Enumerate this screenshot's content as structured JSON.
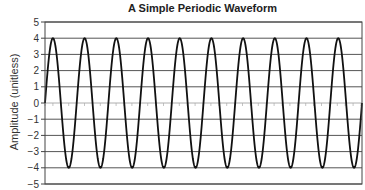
{
  "chart_data": {
    "type": "line",
    "title": "A Simple Periodic Waveform",
    "xlabel": "",
    "ylabel": "Amplitude (unitless)",
    "ylim": [
      -5,
      5
    ],
    "yticks": [
      5,
      4,
      3,
      2,
      1,
      0,
      -1,
      -2,
      -3,
      -4,
      -5
    ],
    "ytick_labels": [
      "5",
      "4",
      "3",
      "2",
      "1",
      "0",
      "−1",
      "−2",
      "−3",
      "−4",
      "−5"
    ],
    "grid": "horizontal",
    "legend": null,
    "series": [
      {
        "name": "waveform",
        "function": "4*sin(2*pi*t)",
        "amplitude": 4,
        "cycles": 10,
        "color": "#111111"
      }
    ],
    "zero_line_minor_ticks": true
  },
  "colors": {
    "grid": "#555555",
    "line": "#111111",
    "frame": "#444444"
  }
}
